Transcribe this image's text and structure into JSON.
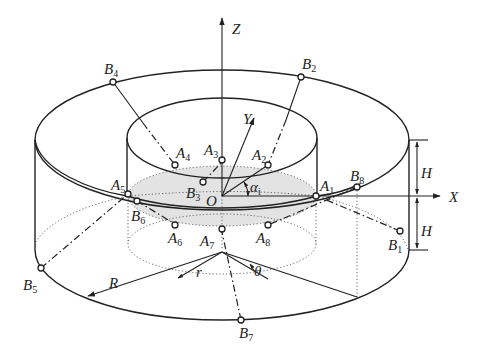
{
  "figure": {
    "axes": {
      "x": "X",
      "y": "Y",
      "z": "Z",
      "origin": "O"
    },
    "dimensions": {
      "outer_radius": "R",
      "inner_radius": "r",
      "half_height_upper": "H",
      "half_height_lower": "H",
      "angle_theta": "θ",
      "angle_alpha": "α",
      "angle_alpha_sub": "i"
    },
    "platform_points": [
      {
        "name": "A",
        "sub": "1"
      },
      {
        "name": "A",
        "sub": "2"
      },
      {
        "name": "A",
        "sub": "3"
      },
      {
        "name": "A",
        "sub": "4"
      },
      {
        "name": "A",
        "sub": "5"
      },
      {
        "name": "A",
        "sub": "6"
      },
      {
        "name": "A",
        "sub": "7"
      },
      {
        "name": "A",
        "sub": "8"
      }
    ],
    "base_points": [
      {
        "name": "B",
        "sub": "1"
      },
      {
        "name": "B",
        "sub": "2"
      },
      {
        "name": "B",
        "sub": "3"
      },
      {
        "name": "B",
        "sub": "4"
      },
      {
        "name": "B",
        "sub": "5"
      },
      {
        "name": "B",
        "sub": "6"
      },
      {
        "name": "B",
        "sub": "7"
      },
      {
        "name": "B",
        "sub": "8"
      }
    ],
    "colors": {
      "line": "#222222",
      "shading": "#e3e3e3"
    }
  }
}
